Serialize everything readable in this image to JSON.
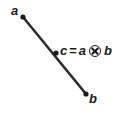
{
  "figure": {
    "background_color": "#ffffff",
    "stroke_color": "#2b2b2b",
    "text_color": "#1a1a1a",
    "width": 117,
    "height": 118
  },
  "labels": {
    "point_a": "a",
    "point_b": "b",
    "formula_left": "c",
    "formula_equals": "=",
    "formula_operand_a": "a",
    "formula_operator": "⊗",
    "formula_operand_b": "b",
    "formula_full": "c = a ⊗ b"
  },
  "geometry": {
    "line": {
      "x1": 23,
      "y1": 17,
      "x2": 86,
      "y2": 94,
      "stroke_width": 2.6
    },
    "points": [
      {
        "name": "a",
        "cx": 23,
        "cy": 17,
        "r": 2.6
      },
      {
        "name": "c",
        "cx": 56,
        "cy": 53,
        "r": 2.6
      },
      {
        "name": "b",
        "cx": 86,
        "cy": 94,
        "r": 2.6
      }
    ]
  }
}
